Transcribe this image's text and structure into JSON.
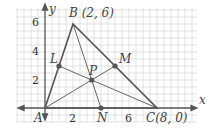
{
  "diagram": {
    "axes": {
      "x_label": "x",
      "y_label": "y",
      "x_ticks": [
        "2",
        "6"
      ],
      "y_ticks": [
        "2",
        "4",
        "6"
      ]
    },
    "points": {
      "A": {
        "label": "A",
        "coords": [
          0,
          0
        ]
      },
      "B": {
        "label": "B (2, 6)",
        "coords": [
          2,
          6
        ]
      },
      "C": {
        "label": "C(8, 0)",
        "coords": [
          8,
          0
        ]
      },
      "L": {
        "label": "L",
        "coords": [
          1,
          3
        ]
      },
      "M": {
        "label": "M",
        "coords": [
          5,
          3
        ]
      },
      "N": {
        "label": "N",
        "coords": [
          4,
          0
        ]
      },
      "P": {
        "label": "P",
        "coords": [
          3.33,
          2
        ]
      }
    },
    "colors": {
      "grid": "#cfcfcf",
      "lines": "#555555",
      "points": "#555555"
    }
  }
}
